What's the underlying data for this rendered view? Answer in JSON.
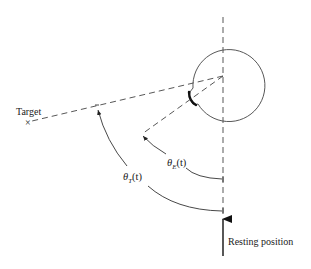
{
  "diagram": {
    "type": "eye-tracking angle diagram",
    "labels": {
      "target": "Target",
      "target_marker": "×",
      "resting": "Resting position",
      "theta_e": {
        "symbol": "θ",
        "subscript": "E",
        "arg": "(t)"
      },
      "theta_t": {
        "symbol": "θ",
        "subscript": "T",
        "arg": "(t)"
      }
    },
    "elements": [
      "vertical dashed reference axis",
      "eyeball circle with corneal bulge",
      "dashed line from eye center to target",
      "dashed line showing eye gaze direction",
      "arc θE(t) from reference axis to gaze line",
      "arc θT(t) from reference axis to target line",
      "arrow indicating resting position"
    ],
    "colors": {
      "stroke": "#333333",
      "background": "#ffffff"
    }
  }
}
